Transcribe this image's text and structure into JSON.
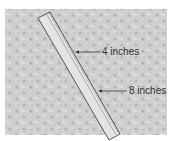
{
  "diagram": {
    "labels": [
      {
        "text": "4 inches",
        "x": 102,
        "y": 47
      },
      {
        "text": "8 inches",
        "x": 129,
        "y": 85
      }
    ],
    "colors": {
      "background_texture": "#c8c8c8",
      "ruler_fill": "#e6e6e6",
      "ruler_edge": "#555555",
      "text": "#333333"
    }
  }
}
